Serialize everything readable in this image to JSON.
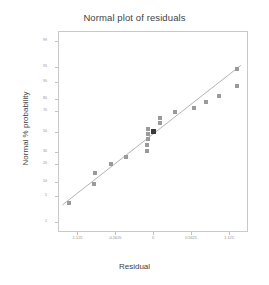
{
  "chart_data": {
    "type": "scatter",
    "title": "Normal plot of residuals",
    "xlabel": "Residual",
    "ylabel": "Normal % probability",
    "grid": false,
    "legend": null,
    "xlim": [
      -1.40625,
      1.40625
    ],
    "xticks": [
      -1.125,
      -0.5625,
      0,
      0.5625,
      1.125
    ],
    "xticklabels": [
      "-1.125",
      "-0.5625",
      "0",
      "0.5625",
      "1.125"
    ],
    "yscale": "normal-probability",
    "ylim": [
      0.5,
      99.5
    ],
    "yticks": [
      99,
      95,
      90,
      80,
      70,
      50,
      30,
      20,
      10,
      5,
      1
    ],
    "yticklabels": [
      "99",
      "95",
      "90",
      "80",
      "70",
      "50",
      "30",
      "20",
      "10",
      "5",
      "1"
    ],
    "point_color": "#9a9a9a",
    "highlight_color": "#3a3a3a",
    "line_color": "#a8a8a8",
    "frame_color": "#c9c9c9",
    "reference_line": {
      "label": "normal reference line",
      "x": [
        -1.34,
        1.3
      ],
      "y": [
        3.0,
        95.5
      ]
    },
    "points": [
      {
        "x": -1.24,
        "y": 3.3,
        "highlight": false
      },
      {
        "x": -0.88,
        "y": 8.9,
        "highlight": false
      },
      {
        "x": -0.86,
        "y": 14.5,
        "highlight": false
      },
      {
        "x": -0.62,
        "y": 20.0,
        "highlight": false
      },
      {
        "x": -0.4,
        "y": 25.5,
        "highlight": false
      },
      {
        "x": -0.09,
        "y": 31.0,
        "highlight": false
      },
      {
        "x": -0.09,
        "y": 36.5,
        "highlight": false
      },
      {
        "x": -0.08,
        "y": 42.0,
        "highlight": false
      },
      {
        "x": -0.08,
        "y": 47.5,
        "highlight": false
      },
      {
        "x": -0.07,
        "y": 53.0,
        "highlight": false
      },
      {
        "x": 0.0,
        "y": 50.0,
        "highlight": true
      },
      {
        "x": 0.1,
        "y": 58.5,
        "highlight": false
      },
      {
        "x": 0.1,
        "y": 64.0,
        "highlight": false
      },
      {
        "x": 0.33,
        "y": 69.5,
        "highlight": false
      },
      {
        "x": 0.6,
        "y": 73.0,
        "highlight": false
      },
      {
        "x": 0.79,
        "y": 77.5,
        "highlight": false
      },
      {
        "x": 0.97,
        "y": 82.0,
        "highlight": false
      },
      {
        "x": 1.25,
        "y": 88.0,
        "highlight": false
      },
      {
        "x": 1.25,
        "y": 94.5,
        "highlight": false
      }
    ]
  },
  "axes": {
    "title": "Normal plot of residuals",
    "x_title": "Residual",
    "y_title": "Normal % probability"
  }
}
